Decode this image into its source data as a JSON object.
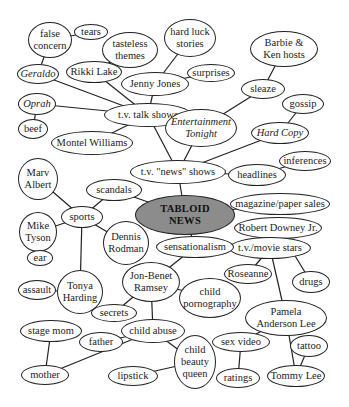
{
  "diagram": {
    "type": "concept-map",
    "central_topic": "TABLOID NEWS",
    "nodes": [
      {
        "id": "tabloid",
        "label": "TABLOID\nNEWS",
        "x": 185,
        "y": 215,
        "w": 100,
        "h": 40,
        "style": "center"
      },
      {
        "id": "tvnews",
        "label": "t.v. \"news\" shows",
        "x": 178,
        "y": 172,
        "w": 96,
        "h": 24
      },
      {
        "id": "tvtalk",
        "label": "t.v. talk shows",
        "x": 148,
        "y": 115,
        "w": 88,
        "h": 24
      },
      {
        "id": "etonight",
        "label": "Entertainment\nTonight",
        "x": 201,
        "y": 128,
        "w": 72,
        "h": 38,
        "style": "italic"
      },
      {
        "id": "hardcopy",
        "label": "Hard Copy",
        "x": 280,
        "y": 133,
        "w": 58,
        "h": 22,
        "style": "italic"
      },
      {
        "id": "gossip",
        "label": "gossip",
        "x": 303,
        "y": 104,
        "w": 42,
        "h": 20
      },
      {
        "id": "sleaze",
        "label": "sleaze",
        "x": 263,
        "y": 89,
        "w": 44,
        "h": 20
      },
      {
        "id": "barbie",
        "label": "Barbie &\nKen hosts",
        "x": 284,
        "y": 49,
        "w": 68,
        "h": 36
      },
      {
        "id": "headlines",
        "label": "headlines",
        "x": 257,
        "y": 175,
        "w": 58,
        "h": 22
      },
      {
        "id": "inferences",
        "label": "inferences",
        "x": 305,
        "y": 161,
        "w": 52,
        "h": 20
      },
      {
        "id": "magazine",
        "label": "magazine/paper sales",
        "x": 280,
        "y": 204,
        "w": 100,
        "h": 22
      },
      {
        "id": "rdj",
        "label": "Robert Downey Jr.",
        "x": 278,
        "y": 228,
        "w": 88,
        "h": 22
      },
      {
        "id": "tvmovie",
        "label": "t.v./movie stars",
        "x": 270,
        "y": 248,
        "w": 82,
        "h": 22
      },
      {
        "id": "roseanne",
        "label": "Roseanne",
        "x": 248,
        "y": 274,
        "w": 48,
        "h": 20
      },
      {
        "id": "drugs",
        "label": "drugs",
        "x": 311,
        "y": 282,
        "w": 38,
        "h": 22
      },
      {
        "id": "pamela",
        "label": "Pamela\nAnderson Lee",
        "x": 286,
        "y": 318,
        "w": 82,
        "h": 36
      },
      {
        "id": "sexvideo",
        "label": "sex video",
        "x": 241,
        "y": 342,
        "w": 58,
        "h": 20
      },
      {
        "id": "ratings",
        "label": "ratings",
        "x": 238,
        "y": 378,
        "w": 44,
        "h": 20
      },
      {
        "id": "tattoo",
        "label": "tattoo",
        "x": 309,
        "y": 346,
        "w": 38,
        "h": 22
      },
      {
        "id": "tommylee",
        "label": "Tommy Lee",
        "x": 296,
        "y": 376,
        "w": 58,
        "h": 22
      },
      {
        "id": "sensationalism",
        "label": "sensationalism",
        "x": 195,
        "y": 247,
        "w": 78,
        "h": 22
      },
      {
        "id": "jonbenet",
        "label": "Jon-Benet\nRamsey",
        "x": 151,
        "y": 282,
        "w": 58,
        "h": 40
      },
      {
        "id": "childporn",
        "label": "child\npornography",
        "x": 210,
        "y": 298,
        "w": 62,
        "h": 40
      },
      {
        "id": "secrets",
        "label": "secrets",
        "x": 114,
        "y": 313,
        "w": 46,
        "h": 18
      },
      {
        "id": "childabuse",
        "label": "child abuse",
        "x": 153,
        "y": 331,
        "w": 64,
        "h": 24
      },
      {
        "id": "father",
        "label": "father",
        "x": 101,
        "y": 342,
        "w": 44,
        "h": 20
      },
      {
        "id": "stagemom",
        "label": "stage mom",
        "x": 51,
        "y": 331,
        "w": 62,
        "h": 22
      },
      {
        "id": "mother",
        "label": "mother",
        "x": 45,
        "y": 375,
        "w": 48,
        "h": 20
      },
      {
        "id": "lipstick",
        "label": "lipstick",
        "x": 133,
        "y": 376,
        "w": 50,
        "h": 20
      },
      {
        "id": "beautyqueen",
        "label": "child\nbeauty\nqueen",
        "x": 195,
        "y": 362,
        "w": 42,
        "h": 54
      },
      {
        "id": "scandals",
        "label": "scandals",
        "x": 114,
        "y": 190,
        "w": 56,
        "h": 22
      },
      {
        "id": "sports",
        "label": "sports",
        "x": 82,
        "y": 217,
        "w": 42,
        "h": 22
      },
      {
        "id": "marv",
        "label": "Marv\nAlbert",
        "x": 38,
        "y": 179,
        "w": 40,
        "h": 42
      },
      {
        "id": "tyson",
        "label": "Mike\nTyson",
        "x": 38,
        "y": 232,
        "w": 38,
        "h": 40
      },
      {
        "id": "ear",
        "label": "ear",
        "x": 40,
        "y": 258,
        "w": 26,
        "h": 16
      },
      {
        "id": "rodman",
        "label": "Dennis\nRodman",
        "x": 126,
        "y": 243,
        "w": 46,
        "h": 44
      },
      {
        "id": "tonya",
        "label": "Tonya\nHarding",
        "x": 80,
        "y": 292,
        "w": 46,
        "h": 44
      },
      {
        "id": "assault",
        "label": "assault",
        "x": 37,
        "y": 290,
        "w": 38,
        "h": 20
      },
      {
        "id": "montel",
        "label": "Montel Williams",
        "x": 92,
        "y": 143,
        "w": 82,
        "h": 24
      },
      {
        "id": "oprah",
        "label": "Oprah",
        "x": 37,
        "y": 104,
        "w": 38,
        "h": 22,
        "style": "italic"
      },
      {
        "id": "beef",
        "label": "beef",
        "x": 33,
        "y": 129,
        "w": 30,
        "h": 20
      },
      {
        "id": "geraldo",
        "label": "Geraldo",
        "x": 38,
        "y": 74,
        "w": 42,
        "h": 20,
        "style": "italic"
      },
      {
        "id": "rikki",
        "label": "Rikki Lake",
        "x": 94,
        "y": 72,
        "w": 56,
        "h": 22
      },
      {
        "id": "falseconcern",
        "label": "false\nconcern",
        "x": 50,
        "y": 40,
        "w": 44,
        "h": 36
      },
      {
        "id": "tears",
        "label": "tears",
        "x": 91,
        "y": 32,
        "w": 34,
        "h": 16
      },
      {
        "id": "tasteless",
        "label": "tasteless\nthemes",
        "x": 130,
        "y": 50,
        "w": 56,
        "h": 36
      },
      {
        "id": "jennyjones",
        "label": "Jenny Jones",
        "x": 155,
        "y": 84,
        "w": 68,
        "h": 24
      },
      {
        "id": "hardluck",
        "label": "hard luck\nstories",
        "x": 190,
        "y": 38,
        "w": 52,
        "h": 38
      },
      {
        "id": "surprises",
        "label": "surprises",
        "x": 211,
        "y": 73,
        "w": 48,
        "h": 18
      }
    ],
    "edges": [
      [
        "tabloid",
        "tvnews"
      ],
      [
        "tvnews",
        "tvtalk"
      ],
      [
        "tvnews",
        "etonight"
      ],
      [
        "tvnews",
        "hardcopy"
      ],
      [
        "tvnews",
        "headlines"
      ],
      [
        "hardcopy",
        "gossip"
      ],
      [
        "etonight",
        "sleaze"
      ],
      [
        "sleaze",
        "barbie"
      ],
      [
        "headlines",
        "inferences"
      ],
      [
        "tabloid",
        "magazine"
      ],
      [
        "tabloid",
        "scandals"
      ],
      [
        "tabloid",
        "sensationalism"
      ],
      [
        "sensationalism",
        "tvmovie"
      ],
      [
        "sensationalism",
        "jonbenet"
      ],
      [
        "tvmovie",
        "rdj"
      ],
      [
        "tvmovie",
        "roseanne"
      ],
      [
        "tvmovie",
        "pamela"
      ],
      [
        "rdj",
        "drugs"
      ],
      [
        "pamela",
        "sexvideo"
      ],
      [
        "pamela",
        "tommylee"
      ],
      [
        "sexvideo",
        "ratings"
      ],
      [
        "tommylee",
        "tattoo"
      ],
      [
        "jonbenet",
        "childporn"
      ],
      [
        "jonbenet",
        "secrets"
      ],
      [
        "jonbenet",
        "childabuse"
      ],
      [
        "childabuse",
        "father"
      ],
      [
        "childabuse",
        "mother"
      ],
      [
        "childabuse",
        "beautyqueen"
      ],
      [
        "beautyqueen",
        "lipstick"
      ],
      [
        "mother",
        "stagemom"
      ],
      [
        "scandals",
        "sports"
      ],
      [
        "sports",
        "marv"
      ],
      [
        "sports",
        "tyson"
      ],
      [
        "sports",
        "rodman"
      ],
      [
        "sports",
        "tonya"
      ],
      [
        "tyson",
        "ear"
      ],
      [
        "tonya",
        "assault"
      ],
      [
        "tvtalk",
        "montel"
      ],
      [
        "tvtalk",
        "oprah"
      ],
      [
        "tvtalk",
        "geraldo"
      ],
      [
        "tvtalk",
        "rikki"
      ],
      [
        "tvtalk",
        "jennyjones"
      ],
      [
        "oprah",
        "beef"
      ],
      [
        "geraldo",
        "falseconcern"
      ],
      [
        "falseconcern",
        "tears"
      ],
      [
        "rikki",
        "tasteless"
      ],
      [
        "jennyjones",
        "hardluck"
      ],
      [
        "jennyjones",
        "surprises"
      ]
    ]
  }
}
